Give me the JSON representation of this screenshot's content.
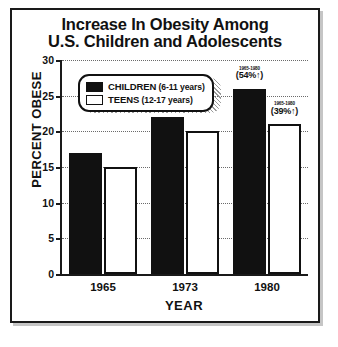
{
  "chart_data": {
    "type": "bar",
    "title": "Increase In Obesity Among U.S. Children and Adolescents",
    "title_lines": [
      "Increase In Obesity Among",
      "U.S. Children and Adolescents"
    ],
    "xlabel": "YEAR",
    "ylabel": "PERCENT OBESE",
    "categories": [
      "1965",
      "1973",
      "1980"
    ],
    "ylim": [
      0,
      30
    ],
    "yticks": [
      0,
      5,
      10,
      15,
      20,
      25,
      30
    ],
    "grid": true,
    "legend_position": "top-left",
    "series": [
      {
        "name": "CHILDREN",
        "age_range": "(6-11 years)",
        "color": "#111111",
        "values": [
          17,
          22,
          26
        ]
      },
      {
        "name": "TEENS",
        "age_range": "(12-17 years)",
        "color": "#ffffff",
        "values": [
          15,
          20,
          21
        ]
      }
    ],
    "annotations": [
      {
        "series": "CHILDREN",
        "category": "1980",
        "period": "1965-1980",
        "delta": "(54%↑)"
      },
      {
        "series": "TEENS",
        "category": "1980",
        "period": "1965-1980",
        "delta": "(39%↑)"
      }
    ]
  },
  "legend": {
    "items": [
      {
        "label": "CHILDREN",
        "sub": " (6-11 years)",
        "swatch": "children"
      },
      {
        "label": "TEENS",
        "sub": " (12-17 years)",
        "swatch": "teens"
      }
    ]
  },
  "colors": {
    "frame": "#1a1a1a",
    "bar_children": "#111111",
    "bar_teens": "#ffffff",
    "grid": "#6b6b6b",
    "background": "#ffffff"
  }
}
